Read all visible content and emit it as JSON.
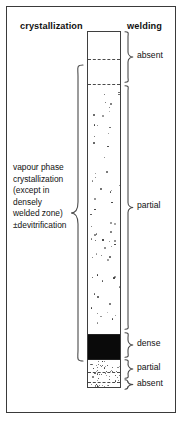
{
  "figure": {
    "headers": {
      "left": "crystallization",
      "right": "welding"
    },
    "left_annotation": {
      "lines": [
        "vapour phase",
        "crystallization",
        "(except in",
        "densely",
        "welded zone)",
        "±devitrification"
      ]
    },
    "column": {
      "name": "stratigraphic-column",
      "bands": [
        {
          "id": "top-absent-upper",
          "label": "absent",
          "fill": "blank",
          "top": 0,
          "height": 27
        },
        {
          "id": "top-absent-lower",
          "label": "absent",
          "fill": "blank",
          "top": 27,
          "height": 25
        },
        {
          "id": "main-partial",
          "label": "partial",
          "fill": "stipple",
          "top": 52,
          "height": 250
        },
        {
          "id": "dense-zone",
          "label": "dense",
          "fill": "black",
          "top": 302,
          "height": 25
        },
        {
          "id": "lower-partial",
          "label": "partial",
          "fill": "stipple",
          "top": 327,
          "height": 23
        },
        {
          "id": "basal-absent",
          "label": "absent",
          "fill": "stipple",
          "top": 350,
          "height": 7
        }
      ],
      "contacts": [
        {
          "y": 27,
          "style": "dashed"
        },
        {
          "y": 52,
          "style": "dashed"
        },
        {
          "y": 302,
          "style": "solid"
        },
        {
          "y": 327,
          "style": "solid"
        },
        {
          "y": 340,
          "style": "dashed"
        },
        {
          "y": 350,
          "style": "dashed"
        }
      ]
    },
    "welding_zones": [
      {
        "label": "absent",
        "brace_top": 31,
        "brace_height": 52,
        "label_y": 51
      },
      {
        "label": "partial",
        "brace_top": 85,
        "brace_height": 245,
        "label_y": 201
      },
      {
        "label": "dense",
        "brace_top": 332,
        "brace_height": 26,
        "label_y": 339
      },
      {
        "label": "partial",
        "brace_top": 359,
        "brace_height": 20,
        "label_y": 363
      },
      {
        "label": "absent",
        "brace_top": 379,
        "brace_height": 11,
        "label_y": 379
      }
    ],
    "colors": {
      "ink": "#1a1a1a",
      "frame": "#3a3a3a",
      "dense_fill": "#0a0a0a",
      "background": "#ffffff"
    }
  }
}
